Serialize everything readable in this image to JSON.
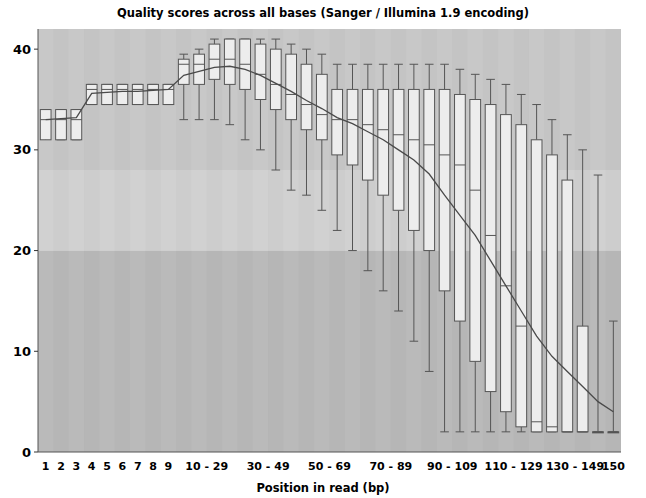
{
  "chart_data": {
    "type": "boxplot",
    "title": "Quality scores across all bases (Sanger / Illumina 1.9 encoding)",
    "xlabel": "Position in read (bp)",
    "ylabel": "",
    "ylim": [
      0,
      42
    ],
    "yticks": [
      0,
      10,
      20,
      30,
      40
    ],
    "ytick_labels": [
      "0",
      "10",
      "20",
      "30",
      "40"
    ],
    "grid": false,
    "legend": "none",
    "background_bands": [
      {
        "name": "good",
        "from": 28,
        "to": 42,
        "color": "#c8c8c8"
      },
      {
        "name": "warn",
        "from": 20,
        "to": 28,
        "color": "#d4d4d4"
      },
      {
        "name": "bad",
        "from": 0,
        "to": 20,
        "color": "#b4b4b4"
      }
    ],
    "column_stripe_colors": [
      "#c9c9c9",
      "#bdbdbd"
    ],
    "box_fill": "#ededed",
    "box_stroke": "#555555",
    "median_color": "#555555",
    "whisker_color": "#555555",
    "mean_line_color": "#4a4a4a",
    "categories": [
      "1",
      "2",
      "3",
      "4",
      "5",
      "6",
      "7",
      "8",
      "9",
      "10-14",
      "15-19",
      "20-24",
      "25-29",
      "30-34",
      "35-39",
      "40-44",
      "45-49",
      "50-54",
      "55-59",
      "60-64",
      "65-69",
      "70-74",
      "75-79",
      "80-84",
      "85-89",
      "90-94",
      "95-99",
      "100-104",
      "105-109",
      "110-114",
      "115-119",
      "120-124",
      "125-129",
      "130-134",
      "135-139",
      "140-144",
      "145-149",
      "150"
    ],
    "xtick_labels": [
      "1",
      "2",
      "3",
      "4",
      "5",
      "6",
      "7",
      "8",
      "9",
      "10 - 29",
      "30 - 49",
      "50 - 69",
      "70 - 89",
      "90 - 109",
      "110 - 129",
      "130 - 149",
      "150"
    ],
    "boxes": [
      {
        "cat": "1",
        "lower_whisker": 34.0,
        "q1": 31.0,
        "median": 33.0,
        "q3": 34.0,
        "upper_whisker": 34.0,
        "mean": 33.0
      },
      {
        "cat": "2",
        "lower_whisker": 31.0,
        "q1": 31.0,
        "median": 33.0,
        "q3": 34.0,
        "upper_whisker": 34.0,
        "mean": 33.1
      },
      {
        "cat": "3",
        "lower_whisker": 31.0,
        "q1": 31.0,
        "median": 33.0,
        "q3": 34.0,
        "upper_whisker": 34.0,
        "mean": 33.2
      },
      {
        "cat": "4",
        "lower_whisker": 34.5,
        "q1": 34.5,
        "median": 36.0,
        "q3": 36.5,
        "upper_whisker": 36.5,
        "mean": 35.6
      },
      {
        "cat": "5",
        "lower_whisker": 34.5,
        "q1": 34.5,
        "median": 36.0,
        "q3": 36.5,
        "upper_whisker": 36.5,
        "mean": 35.7
      },
      {
        "cat": "6",
        "lower_whisker": 34.5,
        "q1": 34.5,
        "median": 36.0,
        "q3": 36.5,
        "upper_whisker": 36.5,
        "mean": 35.8
      },
      {
        "cat": "7",
        "lower_whisker": 34.5,
        "q1": 34.5,
        "median": 36.0,
        "q3": 36.5,
        "upper_whisker": 36.5,
        "mean": 35.8
      },
      {
        "cat": "8",
        "lower_whisker": 34.5,
        "q1": 34.5,
        "median": 36.0,
        "q3": 36.5,
        "upper_whisker": 36.5,
        "mean": 35.9
      },
      {
        "cat": "9",
        "lower_whisker": 34.5,
        "q1": 34.5,
        "median": 36.0,
        "q3": 36.5,
        "upper_whisker": 36.5,
        "mean": 36.0
      },
      {
        "cat": "10-14",
        "lower_whisker": 33.0,
        "q1": 36.5,
        "median": 38.5,
        "q3": 39.0,
        "upper_whisker": 39.5,
        "mean": 37.4
      },
      {
        "cat": "15-19",
        "lower_whisker": 33.0,
        "q1": 36.5,
        "median": 38.5,
        "q3": 39.5,
        "upper_whisker": 40.0,
        "mean": 37.8
      },
      {
        "cat": "20-24",
        "lower_whisker": 33.0,
        "q1": 37.0,
        "median": 39.0,
        "q3": 40.5,
        "upper_whisker": 41.0,
        "mean": 38.2
      },
      {
        "cat": "25-29",
        "lower_whisker": 32.5,
        "q1": 36.5,
        "median": 39.0,
        "q3": 41.0,
        "upper_whisker": 41.0,
        "mean": 38.3
      },
      {
        "cat": "30-34",
        "lower_whisker": 31.0,
        "q1": 36.0,
        "median": 38.5,
        "q3": 41.0,
        "upper_whisker": 41.0,
        "mean": 38.0
      },
      {
        "cat": "35-39",
        "lower_whisker": 30.0,
        "q1": 35.0,
        "median": 37.5,
        "q3": 40.5,
        "upper_whisker": 41.0,
        "mean": 37.4
      },
      {
        "cat": "40-44",
        "lower_whisker": 28.0,
        "q1": 34.0,
        "median": 36.5,
        "q3": 40.0,
        "upper_whisker": 41.0,
        "mean": 36.6
      },
      {
        "cat": "45-49",
        "lower_whisker": 26.0,
        "q1": 33.0,
        "median": 35.5,
        "q3": 39.5,
        "upper_whisker": 40.5,
        "mean": 35.8
      },
      {
        "cat": "50-54",
        "lower_whisker": 25.5,
        "q1": 32.0,
        "median": 34.5,
        "q3": 38.5,
        "upper_whisker": 40.0,
        "mean": 34.9
      },
      {
        "cat": "55-59",
        "lower_whisker": 24.0,
        "q1": 31.0,
        "median": 33.5,
        "q3": 37.5,
        "upper_whisker": 39.5,
        "mean": 34.1
      },
      {
        "cat": "60-64",
        "lower_whisker": 22.0,
        "q1": 29.5,
        "median": 33.0,
        "q3": 36.0,
        "upper_whisker": 38.5,
        "mean": 33.2
      },
      {
        "cat": "65-69",
        "lower_whisker": 20.0,
        "q1": 28.5,
        "median": 33.0,
        "q3": 36.0,
        "upper_whisker": 38.5,
        "mean": 32.6
      },
      {
        "cat": "70-74",
        "lower_whisker": 18.0,
        "q1": 27.0,
        "median": 32.5,
        "q3": 36.0,
        "upper_whisker": 38.5,
        "mean": 31.8
      },
      {
        "cat": "75-79",
        "lower_whisker": 16.0,
        "q1": 25.5,
        "median": 32.0,
        "q3": 36.0,
        "upper_whisker": 38.5,
        "mean": 31.0
      },
      {
        "cat": "80-84",
        "lower_whisker": 14.0,
        "q1": 24.0,
        "median": 31.5,
        "q3": 36.0,
        "upper_whisker": 38.5,
        "mean": 30.0
      },
      {
        "cat": "85-89",
        "lower_whisker": 11.0,
        "q1": 22.0,
        "median": 31.0,
        "q3": 36.0,
        "upper_whisker": 38.5,
        "mean": 29.0
      },
      {
        "cat": "90-94",
        "lower_whisker": 8.0,
        "q1": 20.0,
        "median": 30.5,
        "q3": 36.0,
        "upper_whisker": 38.5,
        "mean": 27.6
      },
      {
        "cat": "95-99",
        "lower_whisker": 2.0,
        "q1": 16.0,
        "median": 29.5,
        "q3": 36.0,
        "upper_whisker": 38.5,
        "mean": 25.5
      },
      {
        "cat": "100-104",
        "lower_whisker": 2.0,
        "q1": 13.0,
        "median": 28.5,
        "q3": 35.5,
        "upper_whisker": 38.0,
        "mean": 23.5
      },
      {
        "cat": "105-109",
        "lower_whisker": 2.0,
        "q1": 9.0,
        "median": 26.0,
        "q3": 35.0,
        "upper_whisker": 37.5,
        "mean": 21.5
      },
      {
        "cat": "110-114",
        "lower_whisker": 2.0,
        "q1": 6.0,
        "median": 21.5,
        "q3": 34.5,
        "upper_whisker": 37.0,
        "mean": 19.0
      },
      {
        "cat": "115-119",
        "lower_whisker": 2.0,
        "q1": 4.0,
        "median": 16.5,
        "q3": 33.5,
        "upper_whisker": 36.5,
        "mean": 16.5
      },
      {
        "cat": "120-124",
        "lower_whisker": 2.0,
        "q1": 2.5,
        "median": 12.5,
        "q3": 32.5,
        "upper_whisker": 35.5,
        "mean": 14.0
      },
      {
        "cat": "125-129",
        "lower_whisker": 2.0,
        "q1": 2.0,
        "median": 3.0,
        "q3": 31.0,
        "upper_whisker": 34.5,
        "mean": 11.5
      },
      {
        "cat": "130-134",
        "lower_whisker": 2.0,
        "q1": 2.0,
        "median": 2.5,
        "q3": 29.5,
        "upper_whisker": 33.0,
        "mean": 9.5
      },
      {
        "cat": "135-139",
        "lower_whisker": 2.0,
        "q1": 2.0,
        "median": 2.0,
        "q3": 27.0,
        "upper_whisker": 31.5,
        "mean": 8.0
      },
      {
        "cat": "140-144",
        "lower_whisker": 2.0,
        "q1": 2.0,
        "median": 2.0,
        "q3": 12.5,
        "upper_whisker": 30.0,
        "mean": 6.5
      },
      {
        "cat": "145-149",
        "lower_whisker": 2.0,
        "q1": 2.0,
        "median": 2.0,
        "q3": 2.0,
        "upper_whisker": 27.5,
        "mean": 5.0
      },
      {
        "cat": "150",
        "lower_whisker": 2.0,
        "q1": 2.0,
        "median": 2.0,
        "q3": 2.0,
        "upper_whisker": 13.0,
        "mean": 4.0
      }
    ]
  }
}
